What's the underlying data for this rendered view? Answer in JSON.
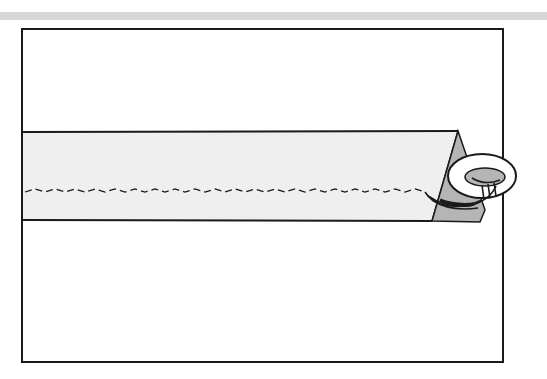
{
  "illustration": {
    "description": "Fabric tube with zigzag stitch line, end folded into triangle and threaded through a ring",
    "colors": {
      "background": "#ffffff",
      "stripe": "#d6d6d6",
      "frame": "#1a1a1a",
      "fabric": "#efefef",
      "fold_shadow": "#b5b5b5",
      "ring": "#ffffff"
    }
  }
}
